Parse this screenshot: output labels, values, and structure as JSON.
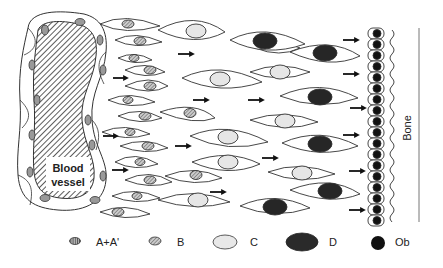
{
  "diagram": {
    "vessel_label_line1": "Blood",
    "vessel_label_line2": "vessel",
    "bone_label": "Bone"
  },
  "legend": {
    "items": [
      {
        "key": "a",
        "label": "A+A'",
        "fill": "hatch-vertical"
      },
      {
        "key": "b",
        "label": "B",
        "fill": "hatch-diagonal"
      },
      {
        "key": "c",
        "label": "C",
        "fill": "#e8e8e8"
      },
      {
        "key": "d",
        "label": "D",
        "fill": "#2a2a2a"
      },
      {
        "key": "ob",
        "label": "Ob",
        "fill": "#111111"
      }
    ]
  },
  "colors": {
    "stroke": "#333333",
    "light_nucleus": "#e6e6e6",
    "dark_nucleus": "#262626",
    "ob_nucleus": "#111111"
  }
}
